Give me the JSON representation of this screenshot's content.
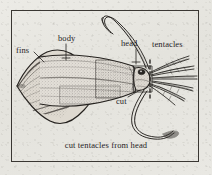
{
  "figure": {
    "caption": "cut tentacles from head",
    "style": "engraved line drawing",
    "frame_color": "#3a3733",
    "ink_color": "#25221f",
    "paper_color": "#e8e7e2"
  },
  "labels": {
    "fins": "fins",
    "body": "body",
    "head": "head",
    "tentacles": "tentacles",
    "cut": "cut"
  },
  "annotations": {
    "cut_line_style": "dashed",
    "cut_line_orientation": "vertical",
    "leader_lines": [
      "fins",
      "body",
      "head",
      "cut"
    ]
  }
}
